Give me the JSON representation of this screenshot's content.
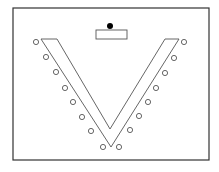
{
  "diagram": {
    "title": "",
    "type": "seating-layout",
    "layout": "V-shape",
    "colors": {
      "background": "#ffffff",
      "stroke": "#555555",
      "frame": "#333333",
      "presenter": "#000000"
    },
    "frame": {
      "x": 13,
      "y": 8,
      "w": 196,
      "h": 152
    },
    "presenter_dot": {
      "cx": 110,
      "cy": 26,
      "r": 3
    },
    "lectern": {
      "x": 96,
      "y": 30,
      "w": 31,
      "h": 9
    },
    "table_outline": [
      [
        41,
        39
      ],
      [
        57,
        39
      ],
      [
        110,
        129
      ],
      [
        165,
        39
      ],
      [
        179,
        39
      ],
      [
        111,
        147
      ]
    ],
    "seats_left": [
      [
        36,
        42
      ],
      [
        46,
        57
      ],
      [
        56,
        72
      ],
      [
        65,
        88
      ],
      [
        73,
        102
      ],
      [
        82,
        117
      ],
      [
        91,
        131
      ],
      [
        103,
        147
      ]
    ],
    "seats_right": [
      [
        184,
        42
      ],
      [
        174,
        58
      ],
      [
        165,
        73
      ],
      [
        156,
        88
      ],
      [
        148,
        102
      ],
      [
        139,
        116
      ],
      [
        130,
        130
      ],
      [
        119,
        147
      ]
    ],
    "seat_radius": 2.6
  }
}
